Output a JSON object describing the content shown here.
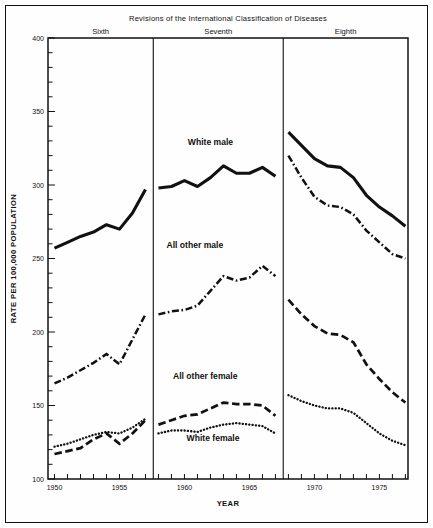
{
  "chart_data": {
    "type": "line",
    "title": "Revisions of the International Classification of Diseases",
    "xlabel": "YEAR",
    "ylabel": "RATE PER 100,000 POPULATION",
    "xlim": [
      1949.5,
      1977.2
    ],
    "ylim": [
      100,
      400
    ],
    "yticks": [
      100,
      150,
      200,
      250,
      300,
      350,
      400
    ],
    "ytick_labels": [
      "100",
      "150",
      "200",
      "250",
      "300",
      "350",
      "400"
    ],
    "yminor_step": 10,
    "xticks": [
      1950,
      1951,
      1952,
      1953,
      1954,
      1955,
      1956,
      1957,
      1958,
      1959,
      1960,
      1961,
      1962,
      1963,
      1964,
      1965,
      1966,
      1967,
      1968,
      1969,
      1970,
      1971,
      1972,
      1973,
      1974,
      1975,
      1976,
      1977
    ],
    "xtick_labels": [
      {
        "x": 1950,
        "label": "1950"
      },
      {
        "x": 1955,
        "label": "1955"
      },
      {
        "x": 1960,
        "label": "1960"
      },
      {
        "x": 1965,
        "label": "1965"
      },
      {
        "x": 1970,
        "label": "1970"
      },
      {
        "x": 1975,
        "label": "1975"
      }
    ],
    "grid": false,
    "legend": "inline-annotations",
    "panels": [
      {
        "name": "Sixth",
        "label": "Sixth",
        "x_start": 1949.5,
        "x_end": 1957.6
      },
      {
        "name": "Seventh",
        "label": "Seventh",
        "x_start": 1957.6,
        "x_end": 1967.6
      },
      {
        "name": "Eighth",
        "label": "Eighth",
        "x_start": 1967.6,
        "x_end": 1977.2
      }
    ],
    "dividers": [
      1957.6,
      1967.6
    ],
    "series": [
      {
        "name": "White male",
        "label": "White male",
        "style": "solid",
        "label_x": 1962.0,
        "label_y": 327,
        "segments": [
          {
            "panel": "Sixth",
            "x": [
              1950,
              1951,
              1952,
              1953,
              1954,
              1955,
              1956,
              1957
            ],
            "values": [
              257,
              261,
              265,
              268,
              273,
              270,
              281,
              297
            ]
          },
          {
            "panel": "Seventh",
            "x": [
              1958,
              1959,
              1960,
              1961,
              1962,
              1963,
              1964,
              1965,
              1966,
              1967
            ],
            "values": [
              298,
              299,
              303,
              299,
              305,
              313,
              308,
              308,
              312,
              306
            ]
          },
          {
            "panel": "Eighth",
            "x": [
              1968,
              1969,
              1970,
              1971,
              1972,
              1973,
              1974,
              1975,
              1976,
              1977
            ],
            "values": [
              336,
              327,
              318,
              313,
              312,
              305,
              293,
              285,
              279,
              272
            ]
          }
        ]
      },
      {
        "name": "All other male",
        "label": "All other male",
        "style": "dash-dot",
        "label_x": 1960.8,
        "label_y": 257,
        "segments": [
          {
            "panel": "Sixth",
            "x": [
              1950,
              1951,
              1952,
              1953,
              1954,
              1955,
              1956,
              1957
            ],
            "values": [
              165,
              169,
              174,
              179,
              185,
              178,
              195,
              212
            ]
          },
          {
            "panel": "Seventh",
            "x": [
              1958,
              1959,
              1960,
              1961,
              1962,
              1963,
              1964,
              1965,
              1966,
              1967
            ],
            "values": [
              212,
              214,
              215,
              218,
              228,
              238,
              235,
              237,
              245,
              238
            ]
          },
          {
            "panel": "Eighth",
            "x": [
              1968,
              1969,
              1970,
              1971,
              1972,
              1973,
              1974,
              1975,
              1976,
              1977
            ],
            "values": [
              320,
              305,
              292,
              286,
              285,
              280,
              269,
              261,
              253,
              250
            ]
          }
        ]
      },
      {
        "name": "All other female",
        "label": "All other female",
        "style": "dashed",
        "label_x": 1961.6,
        "label_y": 168,
        "segments": [
          {
            "panel": "Sixth",
            "x": [
              1950,
              1951,
              1952,
              1953,
              1954,
              1955,
              1956,
              1957
            ],
            "values": [
              117,
              119,
              121,
              127,
              131,
              124,
              131,
              140
            ]
          },
          {
            "panel": "Seventh",
            "x": [
              1958,
              1959,
              1960,
              1961,
              1962,
              1963,
              1964,
              1965,
              1966,
              1967
            ],
            "values": [
              137,
              140,
              143,
              144,
              148,
              152,
              151,
              151,
              150,
              143
            ]
          },
          {
            "panel": "Eighth",
            "x": [
              1968,
              1969,
              1970,
              1971,
              1972,
              1973,
              1974,
              1975,
              1976,
              1977
            ],
            "values": [
              222,
              212,
              204,
              199,
              198,
              193,
              178,
              168,
              159,
              152
            ]
          }
        ]
      },
      {
        "name": "White female",
        "label": "White female",
        "style": "dotted",
        "label_x": 1962.2,
        "label_y": 126,
        "segments": [
          {
            "panel": "Sixth",
            "x": [
              1950,
              1951,
              1952,
              1953,
              1954,
              1955,
              1956,
              1957
            ],
            "values": [
              122,
              124,
              127,
              130,
              132,
              131,
              135,
              141
            ]
          },
          {
            "panel": "Seventh",
            "x": [
              1958,
              1959,
              1960,
              1961,
              1962,
              1963,
              1964,
              1965,
              1966,
              1967
            ],
            "values": [
              131,
              133,
              133,
              132,
              135,
              137,
              138,
              137,
              136,
              131
            ]
          },
          {
            "panel": "Eighth",
            "x": [
              1968,
              1969,
              1970,
              1971,
              1972,
              1973,
              1974,
              1975,
              1976,
              1977
            ],
            "values": [
              157,
              153,
              150,
              148,
              148,
              145,
              138,
              131,
              126,
              123
            ]
          }
        ]
      }
    ]
  }
}
